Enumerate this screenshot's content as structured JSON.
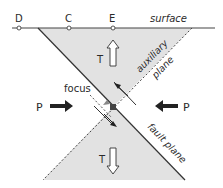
{
  "points": [
    {
      "label": "D",
      "x": 19
    },
    {
      "label": "C",
      "x": 69
    },
    {
      "label": "E",
      "x": 113
    }
  ],
  "labels": {
    "surface": "surface",
    "auxiliary_plane_1": "auxiliary",
    "auxiliary_plane_2": "plane",
    "fault_plane": "fault plane",
    "focus": "focus",
    "p_left": "P",
    "p_right": "P",
    "t_top": "T",
    "t_bottom": "T"
  },
  "colors": {
    "shade": "#e2e2e2",
    "line": "#333333",
    "arrow": "#222222"
  }
}
